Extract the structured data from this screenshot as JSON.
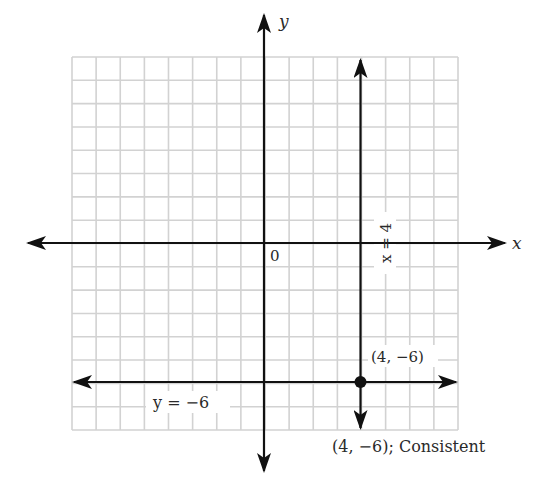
{
  "chart_data": {
    "type": "line",
    "title": "",
    "xlabel": "x",
    "ylabel": "y",
    "origin_label": "0",
    "xlim": [
      -8,
      8
    ],
    "ylim": [
      -8,
      8
    ],
    "grid": true,
    "grid_step": 1,
    "series": [
      {
        "name": "x = 4",
        "kind": "vertical",
        "x": 4,
        "y_range": [
          -8,
          8
        ],
        "arrows": "both"
      },
      {
        "name": "y = -6",
        "kind": "horizontal",
        "y": -6,
        "x_range": [
          -8,
          8
        ],
        "arrows": "both"
      }
    ],
    "points": [
      {
        "x": 4,
        "y": -6,
        "label": "(4, −6)"
      }
    ],
    "annotations": [
      {
        "text": "x = 4",
        "rotation": -90,
        "at": [
          4.9,
          0
        ]
      },
      {
        "text": "y = −6",
        "at": [
          -4.5,
          -7
        ]
      },
      {
        "text": "(4, −6); Consistent",
        "at": [
          5,
          -8.8
        ]
      }
    ]
  },
  "labels": {
    "x_axis": "x",
    "y_axis": "y",
    "origin": "0",
    "line_vertical": "x = 4",
    "line_horizontal": "y = −6",
    "point": "(4, −6)",
    "caption": "(4, −6); Consistent"
  },
  "colors": {
    "grid": "#d2d2d2",
    "axis": "#111111",
    "text": "#2a2a2a",
    "background": "#ffffff"
  }
}
